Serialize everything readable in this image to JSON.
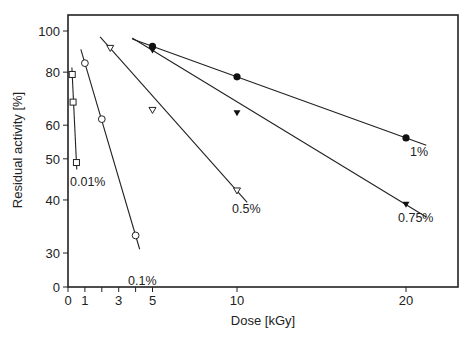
{
  "chart_data": {
    "type": "line",
    "title": "",
    "xlabel": "Dose [kGy]",
    "ylabel": "Residual activity [%]",
    "xlim": [
      0,
      22
    ],
    "ylim": [
      30,
      100
    ],
    "y_scale": "log (axis break to 0)",
    "x_ticks": [
      0,
      1,
      3,
      5,
      10,
      20
    ],
    "x_minor_ticks": [
      2,
      4
    ],
    "y_ticks": [
      0,
      30,
      40,
      50,
      60,
      80,
      100
    ],
    "grid": false,
    "legend": "inline labels at line ends",
    "series": [
      {
        "name": "0.01%",
        "marker": "open-square",
        "x": [
          0.25,
          0.3,
          0.5
        ],
        "y": [
          79,
          68,
          49
        ]
      },
      {
        "name": "0.1%",
        "marker": "open-circle",
        "x": [
          1,
          2,
          4
        ],
        "y": [
          84,
          62,
          33
        ]
      },
      {
        "name": "0.5%",
        "marker": "open-triangle-down",
        "x": [
          2.5,
          5,
          10
        ],
        "y": [
          91,
          65,
          42
        ]
      },
      {
        "name": "0.75%",
        "marker": "filled-triangle-down",
        "x": [
          5,
          10,
          20
        ],
        "y": [
          90,
          64,
          39
        ]
      },
      {
        "name": "1%",
        "marker": "filled-circle",
        "x": [
          5,
          10,
          20
        ],
        "y": [
          92,
          78,
          56
        ]
      }
    ]
  },
  "labels": {
    "xlabel": "Dose [kGy]",
    "ylabel": "Residual activity [%]"
  }
}
